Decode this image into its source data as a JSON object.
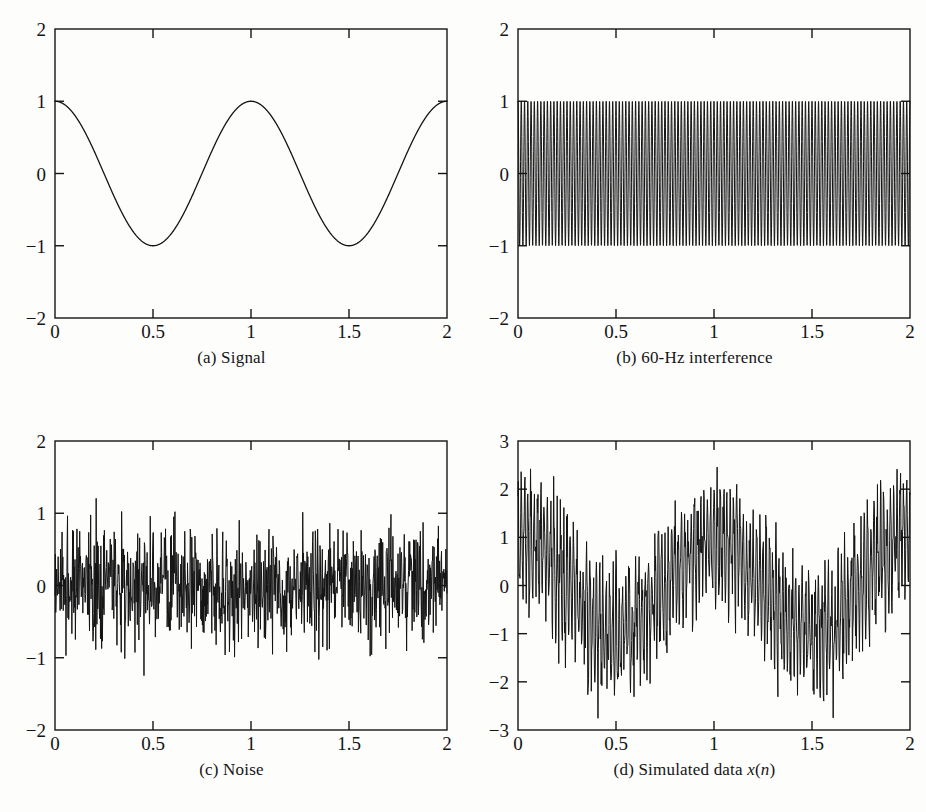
{
  "figure": {
    "background_color": "#fdfdfc",
    "ink_color": "#141414",
    "panel_count": 4
  },
  "panels": [
    {
      "id": "a",
      "caption": "(a) Signal",
      "caption_prefix": "(a) Signal"
    },
    {
      "id": "b",
      "caption": "(b) 60-Hz interference",
      "caption_prefix": "(b) 60-Hz interference"
    },
    {
      "id": "c",
      "caption": "(c) Noise",
      "caption_prefix": "(c) Noise"
    },
    {
      "id": "d",
      "caption": "(d) Simulated data x(n)",
      "caption_prefix": "(d) Simulated data ",
      "caption_var1": "x",
      "caption_paren_open": "(",
      "caption_var2": "n",
      "caption_paren_close": ")"
    }
  ],
  "chart_data": [
    {
      "type": "line",
      "panel": "a",
      "title": "(a) Signal",
      "xlabel": "",
      "ylabel": "",
      "xlim": [
        0,
        2
      ],
      "ylim": [
        -2,
        2
      ],
      "xticks": [
        0,
        0.5,
        1,
        1.5,
        2
      ],
      "xticklabels": [
        "0",
        "0.5",
        "1",
        "1.5",
        "2"
      ],
      "yticks": [
        -2,
        -1,
        0,
        1,
        2
      ],
      "yticklabels": [
        "-2",
        "-1",
        "0",
        "1",
        "2"
      ],
      "grid": false,
      "legend": null,
      "series": [
        {
          "name": "signal",
          "description": "cosine, amplitude 1, frequency 1 Hz",
          "formula": "cos(2*pi*t)",
          "amplitude": 1,
          "frequency_hz": 1,
          "phase": 0,
          "samples": 1000,
          "key_points": [
            {
              "x": 0,
              "y": 1
            },
            {
              "x": 0.25,
              "y": 0
            },
            {
              "x": 0.5,
              "y": -1
            },
            {
              "x": 0.75,
              "y": 0
            },
            {
              "x": 1,
              "y": 1
            },
            {
              "x": 1.25,
              "y": 0
            },
            {
              "x": 1.5,
              "y": -1
            },
            {
              "x": 1.75,
              "y": 0
            },
            {
              "x": 2,
              "y": 1
            }
          ]
        }
      ]
    },
    {
      "type": "line",
      "panel": "b",
      "title": "(b) 60-Hz interference",
      "xlabel": "",
      "ylabel": "",
      "xlim": [
        0,
        2
      ],
      "ylim": [
        -2,
        2
      ],
      "xticks": [
        0,
        0.5,
        1,
        1.5,
        2
      ],
      "xticklabels": [
        "0",
        "0.5",
        "1",
        "1.5",
        "2"
      ],
      "yticks": [
        -2,
        -1,
        0,
        1,
        2
      ],
      "yticklabels": [
        "-2",
        "-1",
        "0",
        "1",
        "2"
      ],
      "grid": false,
      "legend": null,
      "series": [
        {
          "name": "60-Hz interference",
          "description": "sinusoid, amplitude 1, frequency 60 Hz, 120 cycles over 2 s",
          "formula": "cos(2*pi*60*t)",
          "amplitude": 1,
          "frequency_hz": 60,
          "phase": 0,
          "cycles_shown": 120,
          "samples": 1000,
          "envelope": {
            "min": -1,
            "max": 1
          }
        }
      ]
    },
    {
      "type": "line",
      "panel": "c",
      "title": "(c) Noise",
      "xlabel": "",
      "ylabel": "",
      "xlim": [
        0,
        2
      ],
      "ylim": [
        -2,
        2
      ],
      "xticks": [
        0,
        0.5,
        1,
        1.5,
        2
      ],
      "xticklabels": [
        "0",
        "0.5",
        "1",
        "1.5",
        "2"
      ],
      "yticks": [
        -2,
        -1,
        0,
        1,
        2
      ],
      "yticklabels": [
        "-2",
        "-1",
        "0",
        "1",
        "2"
      ],
      "grid": false,
      "legend": null,
      "series": [
        {
          "name": "noise",
          "description": "white Gaussian noise, zero mean",
          "distribution": "gaussian",
          "mean": 0,
          "std": 0.4,
          "observed_min": -1.55,
          "observed_max": 1.35,
          "dense_band": [
            -0.6,
            0.6
          ],
          "samples": 1000
        }
      ]
    },
    {
      "type": "line",
      "panel": "d",
      "title": "(d) Simulated data x(n)",
      "xlabel": "",
      "ylabel": "",
      "xlim": [
        0,
        2
      ],
      "ylim": [
        -3,
        3
      ],
      "xticks": [
        0,
        0.5,
        1,
        1.5,
        2
      ],
      "xticklabels": [
        "0",
        "0.5",
        "1",
        "1.5",
        "2"
      ],
      "yticks": [
        -3,
        -2,
        -1,
        0,
        1,
        2,
        3
      ],
      "yticklabels": [
        "-3",
        "-2",
        "-1",
        "0",
        "1",
        "2",
        "3"
      ],
      "grid": false,
      "legend": null,
      "series": [
        {
          "name": "x(n)",
          "description": "sum of signal, 60-Hz interference and noise",
          "formula": "cos(2*pi*t) + cos(2*pi*60*t) + noise",
          "observed_min": -2.9,
          "observed_max": 3.0,
          "samples": 1000
        }
      ]
    }
  ]
}
